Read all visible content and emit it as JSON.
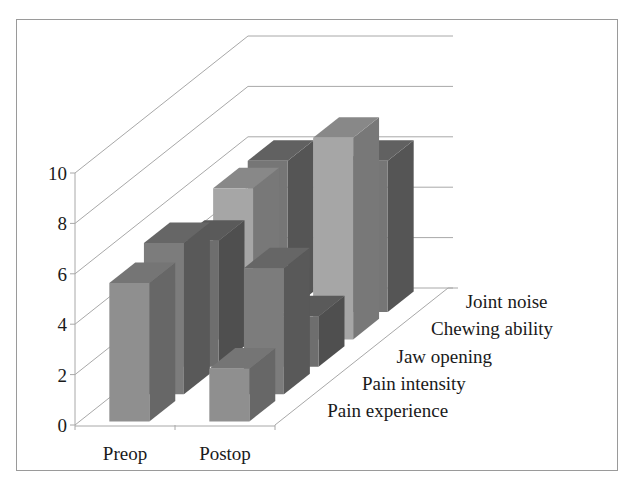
{
  "chart_data": {
    "type": "bar",
    "subtype": "3d-clustered-depth",
    "title": "",
    "xlabel": "",
    "ylabel": "",
    "categories": [
      "Preop",
      "Postop"
    ],
    "series": [
      {
        "name": "Pain experience",
        "values": [
          5.5,
          2.1
        ],
        "color": "#8f8f8f"
      },
      {
        "name": "Pain intensity",
        "values": [
          6.0,
          5.0
        ],
        "color": "#7c7c7c"
      },
      {
        "name": "Jaw opening",
        "values": [
          5.0,
          2.0
        ],
        "color": "#6e6e6e"
      },
      {
        "name": "Chewing ability",
        "values": [
          6.0,
          8.0
        ],
        "color": "#a6a6a6"
      },
      {
        "name": "Joint noise",
        "values": [
          6.0,
          6.0
        ],
        "color": "#767676"
      }
    ],
    "yticks": [
      "0",
      "2",
      "4",
      "6",
      "8",
      "10"
    ],
    "ylim": [
      0,
      10
    ],
    "grid": true,
    "legend_position": "depth-axis labels (right)"
  }
}
